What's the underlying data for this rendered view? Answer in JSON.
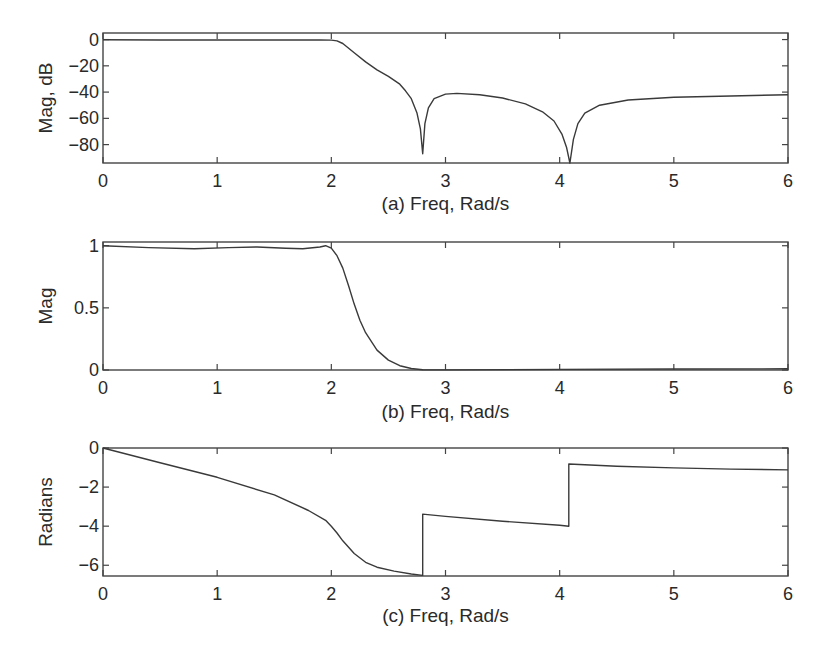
{
  "figure": {
    "panels": [
      {
        "id": "a",
        "xlabel": "(a) Freq, Rad/s",
        "ylabel": "Mag, dB"
      },
      {
        "id": "b",
        "xlabel": "(b) Freq, Rad/s",
        "ylabel": "Mag"
      },
      {
        "id": "c",
        "xlabel": "(c) Freq, Rad/s",
        "ylabel": "Radians"
      }
    ]
  },
  "chart_data": [
    {
      "type": "line",
      "title": "",
      "xlabel": "(a) Freq, Rad/s",
      "ylabel": "Mag, dB",
      "xlim": [
        0,
        6
      ],
      "ylim": [
        -94,
        5
      ],
      "xticks": [
        0,
        1,
        2,
        3,
        4,
        5,
        6
      ],
      "yticks": [
        0,
        -20,
        -40,
        -60,
        -80
      ],
      "grid": false,
      "series": [
        {
          "name": "Magnitude (dB)",
          "x": [
            0,
            0.5,
            1.0,
            1.5,
            1.9,
            2.0,
            2.05,
            2.1,
            2.2,
            2.3,
            2.4,
            2.5,
            2.6,
            2.65,
            2.7,
            2.75,
            2.78,
            2.8,
            2.82,
            2.85,
            2.9,
            3.0,
            3.1,
            3.3,
            3.5,
            3.7,
            3.85,
            3.95,
            4.02,
            4.06,
            4.09,
            4.12,
            4.16,
            4.22,
            4.35,
            4.6,
            5.0,
            5.5,
            6.0
          ],
          "y": [
            -0.2,
            -0.3,
            -0.3,
            -0.3,
            -0.3,
            -0.4,
            -1,
            -3,
            -10,
            -17,
            -23,
            -28,
            -34,
            -39,
            -45,
            -56,
            -68,
            -87,
            -64,
            -52,
            -45,
            -41.5,
            -41,
            -42,
            -44.5,
            -49,
            -55,
            -62,
            -72,
            -82,
            -94,
            -76,
            -64,
            -56,
            -50,
            -46,
            -44,
            -43,
            -42
          ]
        }
      ]
    },
    {
      "type": "line",
      "title": "",
      "xlabel": "(b) Freq, Rad/s",
      "ylabel": "Mag",
      "xlim": [
        0,
        6
      ],
      "ylim": [
        0,
        1.03
      ],
      "xticks": [
        0,
        1,
        2,
        3,
        4,
        5,
        6
      ],
      "yticks": [
        0,
        0.5,
        1
      ],
      "grid": false,
      "series": [
        {
          "name": "Magnitude (linear)",
          "x": [
            0,
            0.4,
            0.8,
            1.1,
            1.35,
            1.6,
            1.75,
            1.9,
            1.95,
            2.0,
            2.05,
            2.1,
            2.15,
            2.2,
            2.25,
            2.3,
            2.4,
            2.5,
            2.6,
            2.7,
            2.8,
            3.0,
            4.0,
            5.0,
            6.0
          ],
          "y": [
            1.0,
            0.985,
            0.975,
            0.985,
            0.99,
            0.98,
            0.975,
            0.99,
            1.0,
            0.98,
            0.92,
            0.82,
            0.68,
            0.53,
            0.4,
            0.3,
            0.16,
            0.08,
            0.035,
            0.012,
            0.002,
            0.001,
            0.005,
            0.008,
            0.01
          ]
        }
      ]
    },
    {
      "type": "line",
      "title": "",
      "xlabel": "(c) Freq, Rad/s",
      "ylabel": "Radians",
      "xlim": [
        0,
        6
      ],
      "ylim": [
        -6.55,
        0
      ],
      "xticks": [
        0,
        1,
        2,
        3,
        4,
        5,
        6
      ],
      "yticks": [
        0,
        -2,
        -4,
        -6
      ],
      "grid": false,
      "series": [
        {
          "name": "Phase (rad)",
          "x": [
            0,
            0.5,
            1.0,
            1.5,
            1.8,
            1.95,
            2.0,
            2.05,
            2.1,
            2.2,
            2.3,
            2.4,
            2.55,
            2.7,
            2.8,
            2.8001,
            3.0,
            3.5,
            4.0,
            4.08,
            4.0801,
            4.5,
            5.0,
            5.5,
            6.0
          ],
          "y": [
            0,
            -0.75,
            -1.5,
            -2.4,
            -3.2,
            -3.7,
            -4.0,
            -4.35,
            -4.75,
            -5.4,
            -5.85,
            -6.1,
            -6.3,
            -6.45,
            -6.52,
            -3.38,
            -3.5,
            -3.75,
            -3.95,
            -4.0,
            -0.82,
            -0.93,
            -1.02,
            -1.08,
            -1.12
          ]
        }
      ]
    }
  ]
}
